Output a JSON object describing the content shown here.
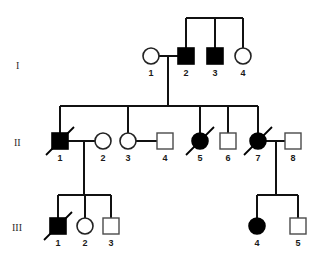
{
  "figure": {
    "kind": "pedigree-chart",
    "generation_labels": [
      "I",
      "II",
      "III"
    ],
    "legend_semantics": {
      "filled": "affected",
      "open": "unaffected",
      "square": "male",
      "circle": "female",
      "slash": "deceased"
    },
    "colors": {
      "affected_fill": "#000000",
      "unaffected_fill": "#ffffff",
      "line": "#111111",
      "open_stroke": "#4a4a4a",
      "label_text": "#1a1a1a",
      "generation_text": "#2b2b2b",
      "background": "#ffffff"
    }
  },
  "generations": [
    {
      "label": "I",
      "label_x": 16,
      "label_y": 69,
      "individuals": [
        {
          "id": "1",
          "shape": "circle",
          "affected": false,
          "deceased": false,
          "cx": 151,
          "cy": 56,
          "r": 8,
          "label_x": 151,
          "label_y": 76
        },
        {
          "id": "2",
          "shape": "square",
          "affected": true,
          "deceased": false,
          "cx": 186,
          "cy": 56,
          "r": 8,
          "label_x": 186,
          "label_y": 76
        },
        {
          "id": "3",
          "shape": "square",
          "affected": true,
          "deceased": false,
          "cx": 215,
          "cy": 56,
          "r": 8,
          "label_x": 215,
          "label_y": 76
        },
        {
          "id": "4",
          "shape": "circle",
          "affected": false,
          "deceased": false,
          "cx": 243,
          "cy": 56,
          "r": 8,
          "label_x": 243,
          "label_y": 76
        }
      ]
    },
    {
      "label": "II",
      "label_x": 14,
      "label_y": 146,
      "individuals": [
        {
          "id": "1",
          "shape": "square",
          "affected": true,
          "deceased": true,
          "cx": 60,
          "cy": 141,
          "r": 8,
          "label_x": 60,
          "label_y": 161
        },
        {
          "id": "2",
          "shape": "circle",
          "affected": false,
          "deceased": false,
          "cx": 103,
          "cy": 141,
          "r": 8,
          "label_x": 103,
          "label_y": 161
        },
        {
          "id": "3",
          "shape": "circle",
          "affected": false,
          "deceased": false,
          "cx": 128,
          "cy": 141,
          "r": 8,
          "label_x": 128,
          "label_y": 161
        },
        {
          "id": "4",
          "shape": "square",
          "affected": false,
          "deceased": false,
          "cx": 165,
          "cy": 141,
          "r": 8,
          "label_x": 165,
          "label_y": 161
        },
        {
          "id": "5",
          "shape": "circle",
          "affected": true,
          "deceased": true,
          "cx": 200,
          "cy": 141,
          "r": 8,
          "label_x": 200,
          "label_y": 161
        },
        {
          "id": "6",
          "shape": "square",
          "affected": false,
          "deceased": false,
          "cx": 228,
          "cy": 141,
          "r": 8,
          "label_x": 228,
          "label_y": 161
        },
        {
          "id": "7",
          "shape": "circle",
          "affected": true,
          "deceased": true,
          "cx": 258,
          "cy": 141,
          "r": 8,
          "label_x": 258,
          "label_y": 161
        },
        {
          "id": "8",
          "shape": "square",
          "affected": false,
          "deceased": false,
          "cx": 293,
          "cy": 141,
          "r": 8,
          "label_x": 293,
          "label_y": 161
        }
      ]
    },
    {
      "label": "III",
      "label_x": 12,
      "label_y": 231,
      "individuals": [
        {
          "id": "1",
          "shape": "square",
          "affected": true,
          "deceased": true,
          "cx": 58,
          "cy": 226,
          "r": 8,
          "label_x": 58,
          "label_y": 246
        },
        {
          "id": "2",
          "shape": "circle",
          "affected": false,
          "deceased": false,
          "cx": 85,
          "cy": 226,
          "r": 8,
          "label_x": 85,
          "label_y": 246
        },
        {
          "id": "3",
          "shape": "square",
          "affected": false,
          "deceased": false,
          "cx": 111,
          "cy": 226,
          "r": 8,
          "label_x": 111,
          "label_y": 246
        },
        {
          "id": "4",
          "shape": "circle",
          "affected": true,
          "deceased": false,
          "cx": 257,
          "cy": 226,
          "r": 8,
          "label_x": 257,
          "label_y": 246
        },
        {
          "id": "5",
          "shape": "square",
          "affected": false,
          "deceased": false,
          "cx": 298,
          "cy": 226,
          "r": 8,
          "label_x": 298,
          "label_y": 246
        }
      ]
    }
  ],
  "connections": [
    {
      "name": "gen0-sibship-bar",
      "x1": 186,
      "y1": 18,
      "x2": 243,
      "y2": 18
    },
    {
      "name": "gen0-drop-to-I2",
      "x1": 186,
      "y1": 18,
      "x2": 186,
      "y2": 48
    },
    {
      "name": "gen0-drop-to-I3",
      "x1": 215,
      "y1": 18,
      "x2": 215,
      "y2": 48
    },
    {
      "name": "gen0-drop-to-I4",
      "x1": 243,
      "y1": 18,
      "x2": 243,
      "y2": 48
    },
    {
      "name": "mating-I1-I2",
      "x1": 159,
      "y1": 56,
      "x2": 178,
      "y2": 56
    },
    {
      "name": "descent-I1xI2",
      "x1": 168,
      "y1": 56,
      "x2": 168,
      "y2": 106
    },
    {
      "name": "genII-sibship-bar",
      "x1": 60,
      "y1": 106,
      "x2": 258,
      "y2": 106
    },
    {
      "name": "drop-to-II1",
      "x1": 60,
      "y1": 106,
      "x2": 60,
      "y2": 133
    },
    {
      "name": "drop-to-II3",
      "x1": 128,
      "y1": 106,
      "x2": 128,
      "y2": 133
    },
    {
      "name": "drop-to-II5",
      "x1": 200,
      "y1": 106,
      "x2": 200,
      "y2": 133
    },
    {
      "name": "drop-to-II6",
      "x1": 228,
      "y1": 106,
      "x2": 228,
      "y2": 133
    },
    {
      "name": "drop-to-II7",
      "x1": 258,
      "y1": 106,
      "x2": 258,
      "y2": 133
    },
    {
      "name": "mating-II1-II2",
      "x1": 68,
      "y1": 141,
      "x2": 95,
      "y2": 141
    },
    {
      "name": "mating-II3-II4",
      "x1": 136,
      "y1": 141,
      "x2": 157,
      "y2": 141
    },
    {
      "name": "mating-II7-II8",
      "x1": 266,
      "y1": 141,
      "x2": 285,
      "y2": 141
    },
    {
      "name": "descent-II1xII2",
      "x1": 84,
      "y1": 141,
      "x2": 84,
      "y2": 195
    },
    {
      "name": "genIII-left-sibship-bar",
      "x1": 58,
      "y1": 195,
      "x2": 111,
      "y2": 195
    },
    {
      "name": "drop-to-III1",
      "x1": 58,
      "y1": 195,
      "x2": 58,
      "y2": 218
    },
    {
      "name": "drop-to-III2",
      "x1": 85,
      "y1": 195,
      "x2": 85,
      "y2": 218
    },
    {
      "name": "drop-to-III3",
      "x1": 111,
      "y1": 195,
      "x2": 111,
      "y2": 218
    },
    {
      "name": "descent-II7xII8",
      "x1": 276,
      "y1": 141,
      "x2": 276,
      "y2": 195
    },
    {
      "name": "genIII-right-sibship-bar",
      "x1": 257,
      "y1": 195,
      "x2": 298,
      "y2": 195
    },
    {
      "name": "drop-to-III4",
      "x1": 257,
      "y1": 195,
      "x2": 257,
      "y2": 218
    },
    {
      "name": "drop-to-III5",
      "x1": 298,
      "y1": 195,
      "x2": 298,
      "y2": 218
    }
  ]
}
